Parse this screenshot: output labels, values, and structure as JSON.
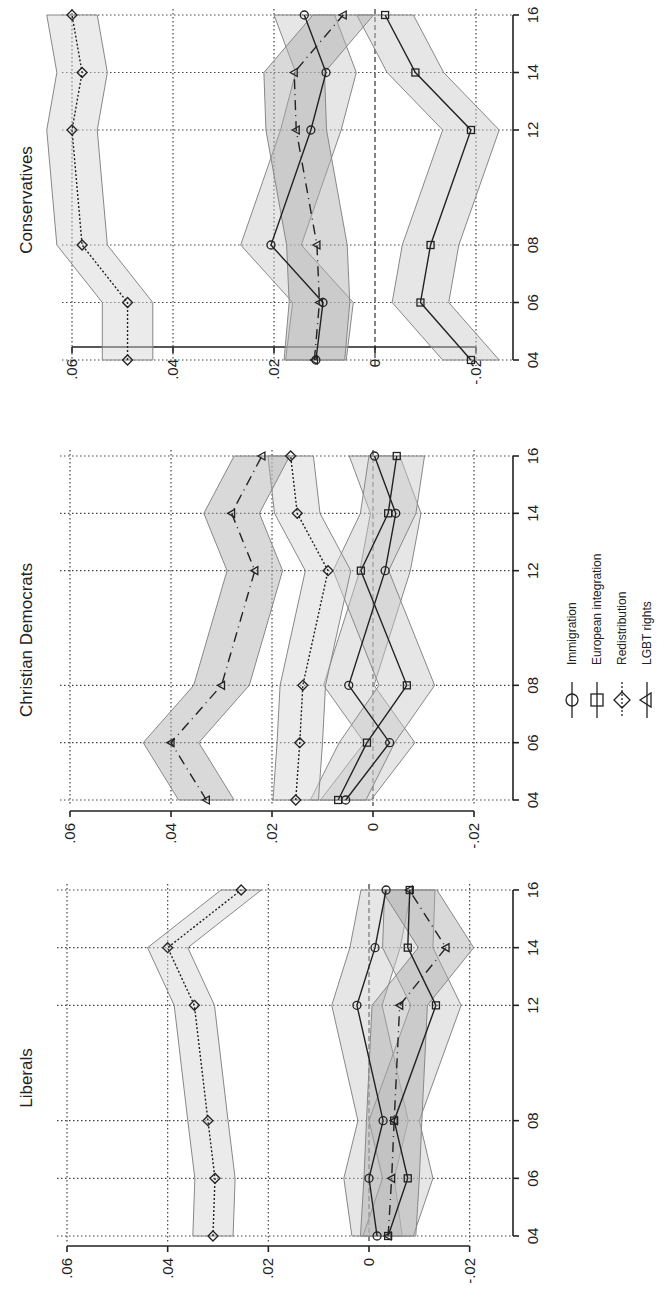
{
  "chart_data": {
    "type": "line",
    "orientation": "rotated-90-ccw",
    "x": [
      "04",
      "06",
      "08",
      "12",
      "14",
      "16"
    ],
    "x_numeric": [
      2004,
      2006,
      2008,
      2012,
      2014,
      2016
    ],
    "ylim": [
      -0.02,
      0.06
    ],
    "yticks": [
      ".06",
      ".04",
      ".02",
      "0",
      "-.02"
    ],
    "ytick_values": [
      0.06,
      0.04,
      0.02,
      0,
      -0.02
    ],
    "grid": true,
    "legend": {
      "position": "right",
      "entries": [
        {
          "label": "Immigration",
          "marker": "circle",
          "line": "solid"
        },
        {
          "label": "European integration",
          "marker": "square",
          "line": "solid"
        },
        {
          "label": "Redistribution",
          "marker": "diamond",
          "line": "dotted"
        },
        {
          "label": "LGBT rights",
          "marker": "triangle",
          "line": "long-dash"
        }
      ]
    },
    "panels": [
      {
        "title": "Conservatives",
        "series": [
          {
            "name": "Immigration",
            "values": [
              0.0117,
              0.0103,
              0.0206,
              0.0127,
              0.0097,
              0.014
            ],
            "ci": 0.006
          },
          {
            "name": "European integration",
            "values": [
              -0.019,
              -0.009,
              -0.011,
              -0.019,
              -0.008,
              -0.002
            ],
            "ci": 0.0056
          },
          {
            "name": "Redistribution",
            "values": [
              0.049,
              0.049,
              0.058,
              0.06,
              0.058,
              0.06
            ],
            "ci": 0.005
          },
          {
            "name": "LGBT rights",
            "values": [
              0.012,
              0.011,
              0.0115,
              0.0156,
              0.016,
              0.0063
            ],
            "ci": 0.006
          }
        ]
      },
      {
        "title": "Christian Democrats",
        "series": [
          {
            "name": "Immigration",
            "values": [
              0.0054,
              -0.0033,
              0.0048,
              -0.0024,
              -0.0045,
              -0.0003
            ],
            "ci": 0.005
          },
          {
            "name": "European integration",
            "values": [
              0.0069,
              0.0012,
              -0.0067,
              0.0024,
              -0.003,
              -0.0047
            ],
            "ci": 0.0055
          },
          {
            "name": "Redistribution",
            "values": [
              0.0153,
              0.0145,
              0.0139,
              0.0089,
              0.015,
              0.0163
            ],
            "ci": 0.0045
          },
          {
            "name": "LGBT rights",
            "values": [
              0.033,
              0.04,
              0.03,
              0.0234,
              0.028,
              0.022
            ],
            "ci": 0.0055
          }
        ]
      },
      {
        "title": "Liberals",
        "series": [
          {
            "name": "Immigration",
            "values": [
              -0.0016,
              0.0,
              -0.0028,
              0.0024,
              -0.0012,
              -0.0034
            ],
            "ci": 0.005
          },
          {
            "name": "European integration",
            "values": [
              -0.0038,
              -0.0077,
              -0.005,
              -0.0133,
              -0.0077,
              -0.0081
            ],
            "ci": 0.005
          },
          {
            "name": "Redistribution",
            "values": [
              0.031,
              0.0306,
              0.032,
              0.0347,
              0.04,
              0.0254
            ],
            "ci": 0.004
          },
          {
            "name": "LGBT rights",
            "values": [
              -0.0038,
              -0.0045,
              -0.005,
              -0.0061,
              -0.0153,
              -0.008
            ],
            "ci": 0.0055
          }
        ]
      }
    ]
  },
  "panels": [
    {
      "title": "Conservatives"
    },
    {
      "title": "Christian Democrats"
    },
    {
      "title": "Liberals"
    }
  ],
  "legend": {
    "items": [
      {
        "label": "Immigration"
      },
      {
        "label": "European integration"
      },
      {
        "label": "Redistribution"
      },
      {
        "label": "LGBT rights"
      }
    ]
  }
}
